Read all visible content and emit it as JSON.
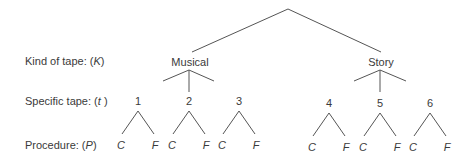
{
  "row_labels": {
    "kind": {
      "text": "Kind of tape: (",
      "var": "K",
      "close": ")"
    },
    "specific": {
      "text": "Specific tape: (",
      "var": "t",
      "close": " )"
    },
    "procedure": {
      "text": "Procedure: (",
      "var": "P",
      "close": ")"
    }
  },
  "tree": {
    "kinds": [
      {
        "label": "Musical",
        "tapes": [
          "1",
          "2",
          "3"
        ]
      },
      {
        "label": "Story",
        "tapes": [
          "4",
          "5",
          "6"
        ]
      }
    ],
    "procedures": [
      "C",
      "F"
    ]
  },
  "leaves": {
    "t1": [
      "C",
      "F"
    ],
    "t2": [
      "C",
      "F"
    ],
    "t3": [
      "C",
      "F"
    ],
    "t4": [
      "C",
      "F"
    ],
    "t5": [
      "C",
      "F"
    ],
    "t6": [
      "C",
      "F"
    ]
  },
  "colors": {
    "line": "#555555",
    "text": "#3a3a3a"
  }
}
